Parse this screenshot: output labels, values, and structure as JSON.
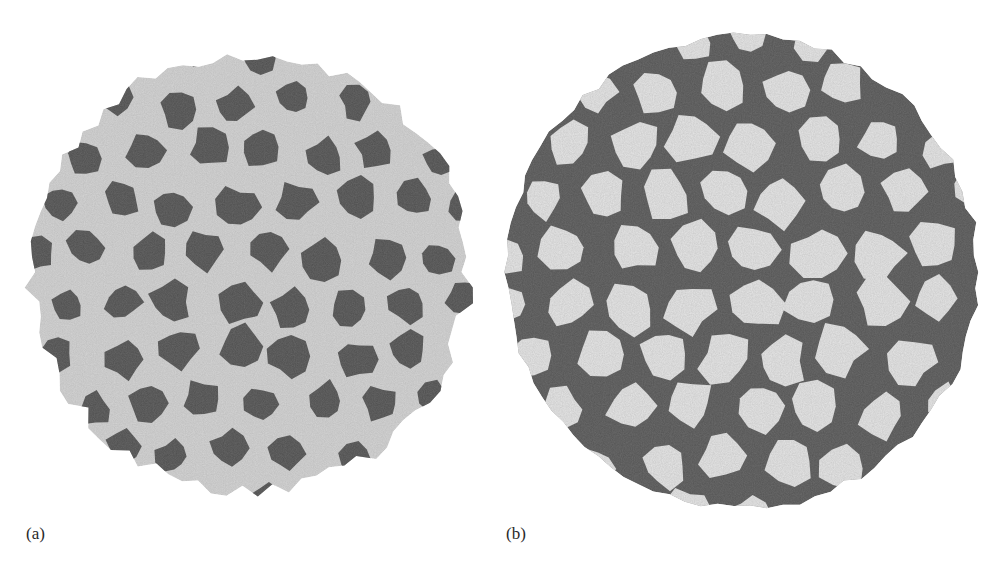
{
  "figure": {
    "panels": [
      {
        "id": "a",
        "label": "(a)",
        "subject": "virus capsid surface rendering",
        "style": "light gray protein surface with dark gray patches",
        "colors": {
          "background": "#d4d4d4",
          "patch": "#4e4e4e",
          "highlight": "#f0f0f0"
        },
        "center": [
          250,
          272
        ],
        "radius": 218
      },
      {
        "id": "b",
        "label": "(b)",
        "subject": "virus capsid surface rendering",
        "style": "dark gray protein surface with light gray star-shaped network",
        "colors": {
          "background": "#545454",
          "patch": "#e6e6e6",
          "highlight": "#6a6a6a"
        },
        "center": [
          742,
          272
        ],
        "radius": 236
      }
    ]
  }
}
